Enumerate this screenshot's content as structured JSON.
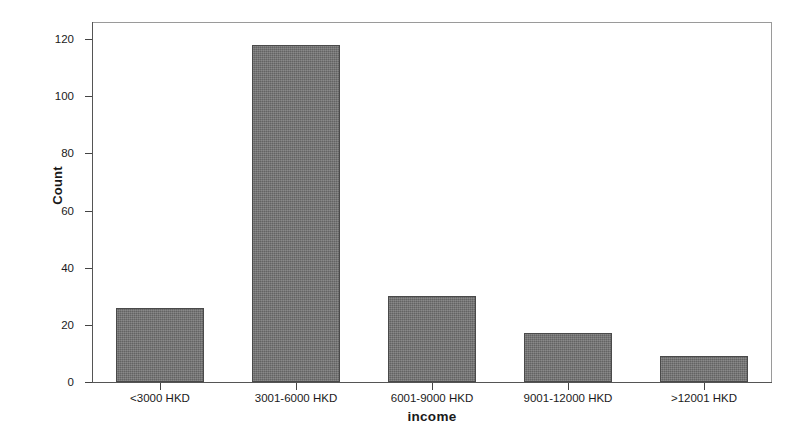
{
  "chart_data": {
    "type": "bar",
    "title": "",
    "xlabel": "income",
    "ylabel": "Count",
    "categories": [
      "<3000 HKD",
      "3001-6000 HKD",
      "6001-9000 HKD",
      "9001-12000 HKD",
      ">12001 HKD"
    ],
    "values": [
      26,
      118,
      30,
      17,
      9
    ],
    "ylim": [
      0,
      126
    ],
    "yticks": [
      0,
      20,
      40,
      60,
      80,
      100,
      120
    ],
    "ytick_labels": [
      "0",
      "20",
      "40",
      "60",
      "80",
      "100",
      "120"
    ],
    "grid": false,
    "legend": false,
    "bar_color": "#6f6f6f",
    "bar_edge_color": "#4a4a4a",
    "frame_color": "#9a9a9a",
    "background": "#ffffff"
  }
}
